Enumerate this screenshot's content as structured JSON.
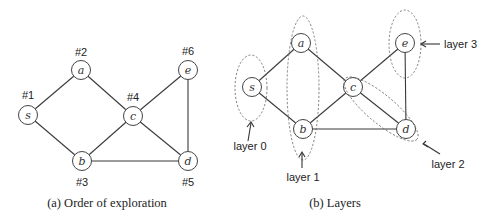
{
  "panel_a": {
    "caption": "(a) Order of exploration",
    "nodes": [
      {
        "id": "s",
        "label": "s",
        "order": "#1",
        "x": 28,
        "y": 115
      },
      {
        "id": "a",
        "label": "a",
        "order": "#2",
        "x": 81,
        "y": 70
      },
      {
        "id": "b",
        "label": "b",
        "order": "#3",
        "x": 82,
        "y": 161
      },
      {
        "id": "c",
        "label": "c",
        "order": "#4",
        "x": 133,
        "y": 116
      },
      {
        "id": "d",
        "label": "d",
        "order": "#5",
        "x": 188,
        "y": 161
      },
      {
        "id": "e",
        "label": "e",
        "order": "#6",
        "x": 188,
        "y": 70
      }
    ]
  },
  "panel_b": {
    "caption": "(b) Layers",
    "nodes": [
      {
        "id": "s",
        "label": "s",
        "x": 252,
        "y": 87
      },
      {
        "id": "a",
        "label": "a",
        "x": 301,
        "y": 43
      },
      {
        "id": "b",
        "label": "b",
        "x": 303,
        "y": 129
      },
      {
        "id": "c",
        "label": "c",
        "x": 353,
        "y": 87
      },
      {
        "id": "d",
        "label": "d",
        "x": 406,
        "y": 129
      },
      {
        "id": "e",
        "label": "e",
        "x": 405,
        "y": 43
      }
    ],
    "layers": [
      {
        "label": "layer 0",
        "members": [
          "s"
        ]
      },
      {
        "label": "layer 1",
        "members": [
          "a",
          "b"
        ]
      },
      {
        "label": "layer 2",
        "members": [
          "c",
          "d"
        ]
      },
      {
        "label": "layer 3",
        "members": [
          "e"
        ]
      }
    ]
  },
  "edges": [
    [
      "s",
      "a"
    ],
    [
      "s",
      "b"
    ],
    [
      "a",
      "c"
    ],
    [
      "b",
      "c"
    ],
    [
      "b",
      "d"
    ],
    [
      "c",
      "d"
    ],
    [
      "c",
      "e"
    ],
    [
      "e",
      "d"
    ]
  ]
}
